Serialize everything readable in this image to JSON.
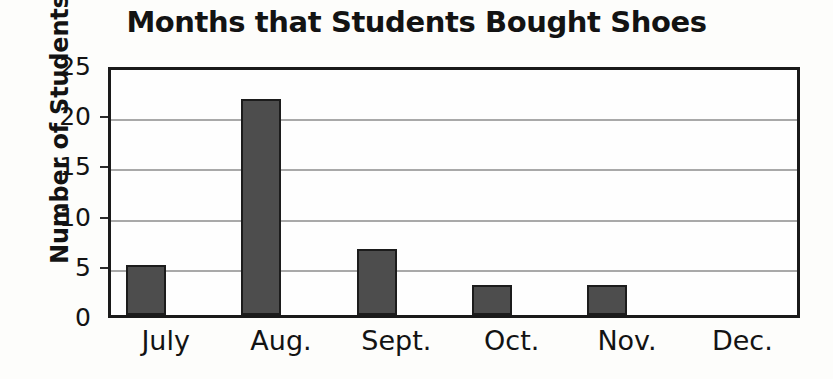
{
  "chart_data": {
    "type": "bar",
    "title": "Months that Students Bought Shoes",
    "xlabel": "",
    "ylabel": "Number of Students",
    "categories": [
      "July",
      "Aug.",
      "Sept.",
      "Oct.",
      "Nov.",
      "Dec."
    ],
    "values": [
      5,
      21.5,
      6.6,
      3,
      3,
      0
    ],
    "ylim": [
      0,
      25
    ],
    "yticks": [
      0,
      5,
      10,
      15,
      20,
      25
    ],
    "ytick_labels": [
      "0",
      "5",
      "10",
      "15",
      "20",
      "25"
    ],
    "gridlines": [
      5,
      10,
      15,
      20
    ],
    "grid": true,
    "legend": false,
    "legend_position": "none",
    "bar_color": "#4d4d4d",
    "bar_edge_color": "#1c1c1c",
    "grid_color": "#a9a9a9",
    "axis_color": "#1a1a1a",
    "text_color": "#131313",
    "background_color": "#fdfdfb"
  }
}
